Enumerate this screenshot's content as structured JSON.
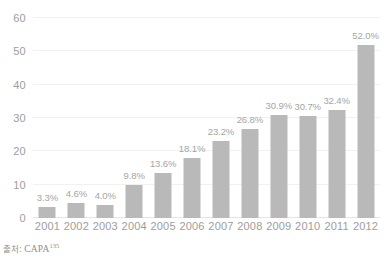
{
  "source_note": {
    "prefix": "출처:",
    "name": "CAPA",
    "footnote": "135"
  },
  "chart_data": {
    "type": "bar",
    "title": "",
    "subtitle": "",
    "xlabel": "",
    "ylabel": "",
    "ylim": [
      0,
      60
    ],
    "yticks": [
      0,
      10,
      20,
      30,
      40,
      50,
      60
    ],
    "ytick_labels": [
      "0",
      "10",
      "20",
      "30",
      "40",
      "50",
      "60"
    ],
    "grid": true,
    "grid_axis": "y",
    "legend": false,
    "bar_color": "#b9b9b9",
    "categories": [
      "2001",
      "2002",
      "2003",
      "2004",
      "2005",
      "2006",
      "2007",
      "2008",
      "2009",
      "2010",
      "2011",
      "2012"
    ],
    "values": [
      3.3,
      4.6,
      4.0,
      9.8,
      13.6,
      18.1,
      23.2,
      26.8,
      30.9,
      30.7,
      32.4,
      52.0
    ],
    "data_labels": [
      "3.3%",
      "4.6%",
      "4.0%",
      "9.8%",
      "13.6%",
      "18.1%",
      "23.2%",
      "26.8%",
      "30.9%",
      "30.7%",
      "32.4%",
      "52.0%"
    ],
    "series": [
      {
        "name": "",
        "values": [
          3.3,
          4.6,
          4.0,
          9.8,
          13.6,
          18.1,
          23.2,
          26.8,
          30.9,
          30.7,
          32.4,
          52.0
        ]
      }
    ]
  }
}
